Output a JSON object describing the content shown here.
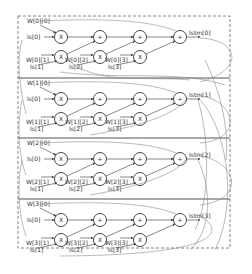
{
  "diagram": {
    "type": "lstm-like multiply-accumulate network",
    "node_ops": {
      "multiply": "X",
      "add": "+"
    },
    "rows": [
      {
        "index": 0,
        "w0": "W[0][0]",
        "is0": "Is[0]",
        "w1": "W[0][1]",
        "w2": "W[0][2]",
        "w3": "W[0][3]",
        "is1": "Is[1]",
        "is2": "Is[2]",
        "is3": "Is[3]",
        "out": "Istm[0]"
      },
      {
        "index": 1,
        "w0": "W[1][0]",
        "is0": "Is[0]",
        "w1": "W[1][1]",
        "w2": "W[1][2]",
        "w3": "W[1][3]",
        "is1": "Is[1]",
        "is2": "Is[2]",
        "is3": "Is[3]",
        "out": "Istm[1]"
      },
      {
        "index": 2,
        "w0": "W[2][0]",
        "is0": "Is[0]",
        "w1": "W[2][1]",
        "w2": "W[2][2]",
        "w3": "W[2][3]",
        "is1": "Is[1]",
        "is2": "Is[2]",
        "is3": "Is[3]",
        "out": "Istm[2]"
      },
      {
        "index": 3,
        "w0": "W[3][0]",
        "is0": "Is[0]",
        "w1": "W[3][1]",
        "w2": "W[3][2]",
        "w3": "W[3][3]",
        "is1": "Is[1]",
        "is2": "Is[2]",
        "is3": "Is[3]",
        "out": "Istm[3]"
      }
    ],
    "colors": {
      "line": "#555555",
      "feedback": "#8a8a8a",
      "dashed_border": "#666666"
    }
  }
}
